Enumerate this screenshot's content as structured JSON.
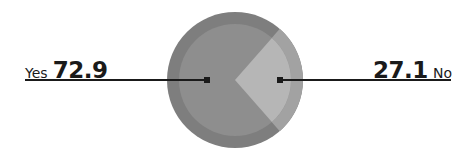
{
  "chart_data": {
    "type": "pie",
    "title": "",
    "categories": [
      "Yes",
      "No"
    ],
    "values": [
      72.9,
      27.1
    ],
    "colors": {
      "Yes": "#8c8c8c",
      "No": "#b4b4b4",
      "ring": "#7a7a7a",
      "ring_light": "#a0a0a0",
      "leader_line": "#1a1a1a"
    },
    "legend": "inline leader-line labels, Yes on left, No on right"
  },
  "labels": {
    "left": {
      "name": "Yes",
      "value": "72.9"
    },
    "right": {
      "name": "No",
      "value": "27.1"
    }
  }
}
